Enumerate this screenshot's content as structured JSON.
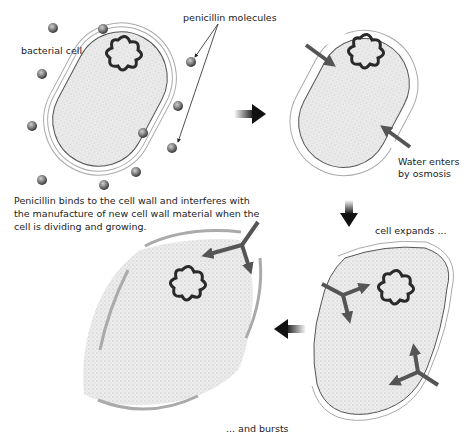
{
  "diagram": {
    "type": "process-illustration",
    "panels": [
      {
        "id": "intact",
        "label": "bacterial cell"
      },
      {
        "id": "osmosis",
        "label": "Water enters by osmosis"
      },
      {
        "id": "expands",
        "label": "cell expands ..."
      },
      {
        "id": "bursts",
        "label": "... and bursts"
      }
    ]
  },
  "labels": {
    "bacterial_cell": "bacterial cell",
    "penicillin_molecules": "penicillin molecules",
    "water_enters_line1": "Water enters",
    "water_enters_line2": "by osmosis",
    "cell_expands": "cell expands ...",
    "and_bursts": "... and bursts",
    "explanation": "Penicillin binds to the cell wall and interferes with the manufacture of new cell wall material when the cell is dividing and growing."
  },
  "colors": {
    "cytoplasm": "#e4e4e4",
    "wall": "#9a9a9a",
    "dna": "#2a2a2a",
    "arrow_flow": "#555555",
    "arrow_step": "#111111",
    "molecule": "#666666"
  }
}
